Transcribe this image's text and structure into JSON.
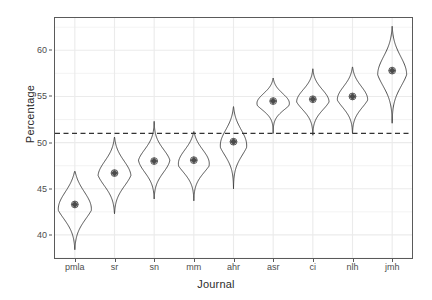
{
  "chart_data": {
    "type": "violin",
    "title": "",
    "xlabel": "Journal",
    "ylabel": "Percentage",
    "categories": [
      "pmla",
      "sr",
      "sn",
      "mm",
      "ahr",
      "asr",
      "ci",
      "nlh",
      "jmh"
    ],
    "ylim": [
      37.5,
      63.5
    ],
    "yticks": [
      40,
      45,
      50,
      55,
      60
    ],
    "ytick_labels": [
      "40",
      "45",
      "50",
      "55",
      "60"
    ],
    "grid": true,
    "legend": "none",
    "reference_line": {
      "value": 51,
      "style": "dashed",
      "color": "#333333"
    },
    "series": [
      {
        "name": "pmla",
        "center": 43.3,
        "low": 38.4,
        "high": 46.9,
        "q_low": 41.2,
        "q_high": 45.4,
        "width": 1.0
      },
      {
        "name": "sr",
        "center": 46.7,
        "low": 42.3,
        "high": 50.6,
        "q_low": 44.8,
        "q_high": 48.6,
        "width": 0.95
      },
      {
        "name": "sn",
        "center": 48.0,
        "low": 43.9,
        "high": 52.3,
        "q_low": 46.3,
        "q_high": 49.7,
        "width": 0.9
      },
      {
        "name": "mm",
        "center": 48.1,
        "low": 43.7,
        "high": 51.2,
        "q_low": 46.4,
        "q_high": 49.8,
        "width": 0.95
      },
      {
        "name": "ahr",
        "center": 50.1,
        "low": 45.0,
        "high": 53.9,
        "q_low": 48.2,
        "q_high": 52.0,
        "width": 0.8
      },
      {
        "name": "asr",
        "center": 54.5,
        "low": 51.0,
        "high": 57.0,
        "q_low": 53.3,
        "q_high": 55.7,
        "width": 1.0
      },
      {
        "name": "ci",
        "center": 54.7,
        "low": 50.8,
        "high": 58.0,
        "q_low": 53.2,
        "q_high": 56.2,
        "width": 0.95
      },
      {
        "name": "nlh",
        "center": 55.0,
        "low": 51.0,
        "high": 58.2,
        "q_low": 53.4,
        "q_high": 56.6,
        "width": 0.9
      },
      {
        "name": "jmh",
        "center": 57.8,
        "low": 52.1,
        "high": 62.6,
        "q_low": 55.6,
        "q_high": 60.0,
        "width": 0.85
      }
    ]
  },
  "panel": {
    "background": "#ffffff",
    "border_color": "#5a5a5a",
    "grid_color": "#ebebeb",
    "violin_color": "#3d3d3d",
    "point_color": "#4a4a4a"
  }
}
